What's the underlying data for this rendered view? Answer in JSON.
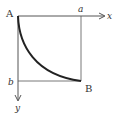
{
  "diagram": {
    "labels": {
      "origin": "A",
      "end_point": "B",
      "x_axis": "x",
      "y_axis": "y",
      "x_mark": "a",
      "y_mark": "b"
    },
    "colors": {
      "stroke": "#555555",
      "curve": "#222222",
      "text": "#333333",
      "background": "#ffffff"
    }
  }
}
